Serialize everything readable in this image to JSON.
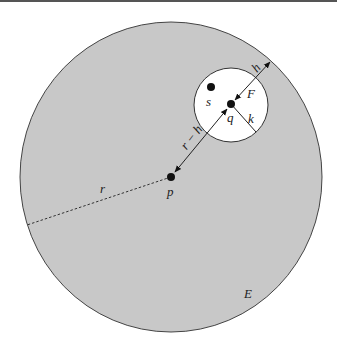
{
  "diagram": {
    "labels": {
      "E": "E",
      "F": "F",
      "h": "h",
      "k": "k",
      "p": "p",
      "q": "q",
      "r": "r",
      "s": "s",
      "r_minus_h": "r − h"
    },
    "colors": {
      "big_disk_fill": "#c8c8c8",
      "small_disk_fill": "#ffffff",
      "stroke": "#333333",
      "point": "#111111"
    },
    "geometry": {
      "big_circle": {
        "cx": 171,
        "cy": 177,
        "r": 153
      },
      "small_circle": {
        "cx": 231,
        "cy": 105,
        "r": 37
      },
      "point_p": {
        "x": 171,
        "y": 177
      },
      "point_q": {
        "x": 231,
        "y": 104
      },
      "point_s": {
        "x": 211,
        "y": 87
      }
    }
  }
}
